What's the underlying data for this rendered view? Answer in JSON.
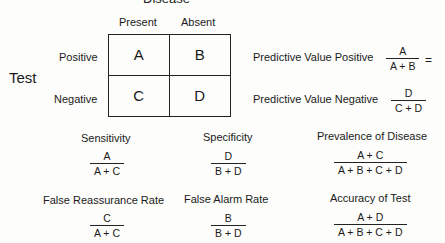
{
  "title": "Disease",
  "columns": [
    "Present",
    "Absent"
  ],
  "row_axis_label": "Test",
  "rows": [
    "Positive",
    "Negative"
  ],
  "cells": [
    "A",
    "B",
    "C",
    "D"
  ],
  "predictive": [
    {
      "label": "Predictive Value Positive",
      "num": "A",
      "den": "A + B",
      "suffix": "="
    },
    {
      "label": "Predictive Value Negative",
      "num": "D",
      "den": "C + D"
    }
  ],
  "measures": [
    {
      "label": "Sensitivity",
      "num": "A",
      "den": "A + C"
    },
    {
      "label": "Specificity",
      "num": "D",
      "den": "B + D"
    },
    {
      "label": "Prevalence of Disease",
      "num": "A + C",
      "den": "A + B + C + D"
    },
    {
      "label": "False Reassurance Rate",
      "num": "C",
      "den": "A + C"
    },
    {
      "label": "False Alarm Rate",
      "num": "B",
      "den": "B + D"
    },
    {
      "label": "Accuracy of Test",
      "num": "A + D",
      "den": "A + B + C + D"
    }
  ]
}
